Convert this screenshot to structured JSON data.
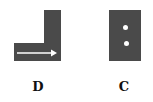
{
  "figures": [
    {
      "label": "D",
      "shape": "L-shape",
      "marking": "arrow-right",
      "fill": "#4a4a4a"
    },
    {
      "label": "C",
      "shape": "rectangle",
      "marking": "two-dots",
      "fill": "#4a4a4a"
    }
  ]
}
